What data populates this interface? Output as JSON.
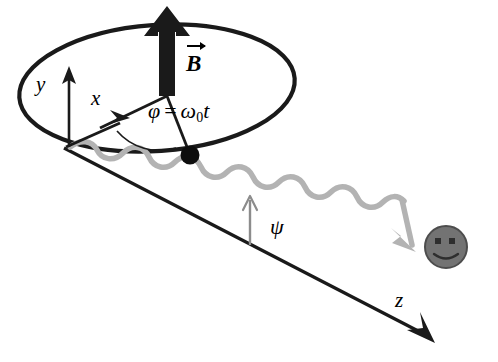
{
  "figure": {
    "width": 498,
    "height": 362,
    "background_color": "#ffffff"
  },
  "colors": {
    "stroke": "#1a1a1a",
    "wave": "#b3b3b3",
    "psi_arrow": "#8c8c8c",
    "smiley_fill": "#737373",
    "smiley_stroke": "#4d4d4d",
    "smiley_features": "#2e2e2e"
  },
  "labels": {
    "y_axis": "y",
    "x_axis": "x",
    "z_axis": "z",
    "psi_angle": "ψ",
    "b_field": "B",
    "phi_symbol": "φ",
    "phi_equals": "=",
    "omega_symbol": "ω",
    "omega_subscript": "0",
    "time_symbol": "t"
  },
  "elements": {
    "ellipse": {
      "name": "rotation-plane-ellipse",
      "cx": 157,
      "cy": 88,
      "rx": 138,
      "ry": 63,
      "rotation_deg": -4
    },
    "b_arrow": {
      "name": "magnetic-field-arrow",
      "x": 167,
      "y_top": 8,
      "y_bottom": 95,
      "shaft_width": 15,
      "head_width": 40,
      "head_height": 28
    },
    "origin": {
      "x": 68,
      "y": 146
    },
    "y_axis_tip": {
      "x": 70,
      "y": 70
    },
    "x_axis_tip": {
      "x": 116,
      "y": 120
    },
    "rotating_point": {
      "x": 190,
      "y": 155,
      "radius": 9
    },
    "z_axis_tip": {
      "x": 434,
      "y": 342
    },
    "smiley": {
      "cx": 446,
      "cy": 247,
      "r": 21
    },
    "psi_arrow": {
      "x": 250,
      "y_base": 243,
      "y_tip": 198
    }
  }
}
